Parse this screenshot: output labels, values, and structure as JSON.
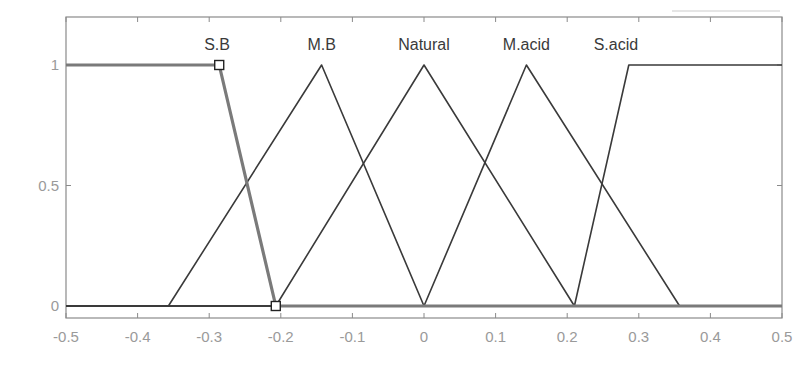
{
  "chart_data": {
    "type": "line",
    "title": "",
    "xlabel": "",
    "ylabel": "",
    "xlim": [
      -0.5,
      0.5
    ],
    "ylim": [
      -0.1,
      1.2
    ],
    "grid": false,
    "legend": "none (labels above peaks)",
    "x_ticks": [
      -0.5,
      -0.4,
      -0.3,
      -0.2,
      -0.1,
      0,
      0.1,
      0.2,
      0.3,
      0.4,
      0.5
    ],
    "x_tick_labels": [
      "-0.5",
      "-0.4",
      "-0.3",
      "-0.2",
      "-0.1",
      "0",
      "0.1",
      "0.2",
      "0.3",
      "0.4",
      "0.5"
    ],
    "y_ticks": [
      0,
      0.5,
      1
    ],
    "y_tick_labels": [
      "0",
      "0.5",
      "1"
    ],
    "series": [
      {
        "name": "S.B",
        "shape": "trapezoid",
        "selected": true,
        "x": [
          -0.5,
          -0.286,
          -0.207,
          0.5
        ],
        "y": [
          1,
          1,
          0,
          0
        ]
      },
      {
        "name": "M.B",
        "shape": "triangle",
        "x": [
          -0.5,
          -0.357,
          -0.143,
          0.0,
          0.5
        ],
        "y": [
          0,
          0,
          1,
          0,
          0
        ]
      },
      {
        "name": "Natural",
        "shape": "triangle",
        "x": [
          -0.5,
          -0.207,
          0.0,
          0.21,
          0.5
        ],
        "y": [
          0,
          0,
          1,
          0,
          0
        ]
      },
      {
        "name": "M.acid",
        "shape": "triangle",
        "x": [
          -0.5,
          0.0,
          0.143,
          0.357,
          0.5
        ],
        "y": [
          0,
          0,
          1,
          0,
          0
        ]
      },
      {
        "name": "S.acid",
        "shape": "trapezoid",
        "x": [
          -0.5,
          0.21,
          0.286,
          0.5
        ],
        "y": [
          0,
          0,
          1,
          1
        ]
      }
    ],
    "annotations": [
      "S.B",
      "M.B",
      "Natural",
      "M.acid",
      "S.acid"
    ]
  },
  "colors": {
    "line": "#3a3a3a",
    "selected_line": "#7a7a7a",
    "axis": "#8a8a8a",
    "tick_label": "#9a9a9a",
    "background": "#ffffff"
  }
}
